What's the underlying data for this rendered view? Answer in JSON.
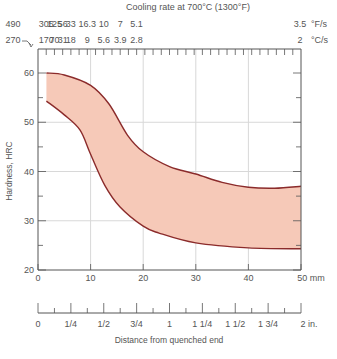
{
  "chart_data": {
    "type": "area",
    "title": "Cooling rate at 700°C (1300°F)",
    "xlabel": "Distance from quenched end",
    "ylabel": "Hardness, HRC",
    "xlim": [
      0,
      50
    ],
    "ylim": [
      20,
      60
    ],
    "grid": true,
    "x_unit_mm": "mm",
    "x_ticks_mm": [
      "0",
      "10",
      "20",
      "30",
      "40",
      "50 mm"
    ],
    "x_tick_values_mm": [
      0,
      10,
      20,
      30,
      40,
      50
    ],
    "y_ticks": [
      "20",
      "30",
      "40",
      "50",
      "60"
    ],
    "y_tick_values": [
      20,
      30,
      40,
      50,
      60
    ],
    "x_ticks_in": [
      "0",
      "1/4",
      "1/2",
      "3/4",
      "1",
      "1 1/4",
      "1 1/2",
      "1 3/4",
      "2 in."
    ],
    "x_tick_values_in": [
      0,
      0.25,
      0.5,
      0.75,
      1,
      1.25,
      1.5,
      1.75,
      2
    ],
    "top_axis": {
      "F_per_s_label": "°F/s",
      "C_per_s_label": "°C/s",
      "F_per_s": [
        "490",
        "305",
        "125",
        "56",
        "33",
        "16.3",
        "10",
        "7",
        "5.1",
        "3.5"
      ],
      "C_per_s": [
        "270",
        "170",
        "70",
        "31",
        "18",
        "9",
        "5.6",
        "3.9",
        "2.8",
        "2"
      ],
      "positions_in": [
        0,
        0.0625,
        0.125,
        0.1875,
        0.25,
        0.375,
        0.5,
        0.625,
        0.75,
        1.0
      ]
    },
    "series": [
      {
        "name": "Upper bound",
        "x": [
          1.6,
          5,
          10,
          13.5,
          17,
          20,
          25,
          30,
          35,
          40,
          45,
          50
        ],
        "values": [
          60,
          59.6,
          57.5,
          53.7,
          47.4,
          44,
          41,
          39.5,
          37.8,
          36.8,
          36.6,
          37
        ]
      },
      {
        "name": "Lower bound",
        "x": [
          1.6,
          5,
          8,
          10,
          12.7,
          15.6,
          20,
          23,
          30,
          40,
          50
        ],
        "values": [
          54.3,
          51.5,
          48.4,
          43.5,
          37.2,
          32.8,
          28.9,
          27.5,
          25.5,
          24.5,
          24.3
        ]
      }
    ],
    "colors": {
      "band_fill": "#f6c9b8",
      "band_stroke": "#8b2b2b",
      "grid": "#d8d8d8",
      "axis": "#555555"
    }
  }
}
